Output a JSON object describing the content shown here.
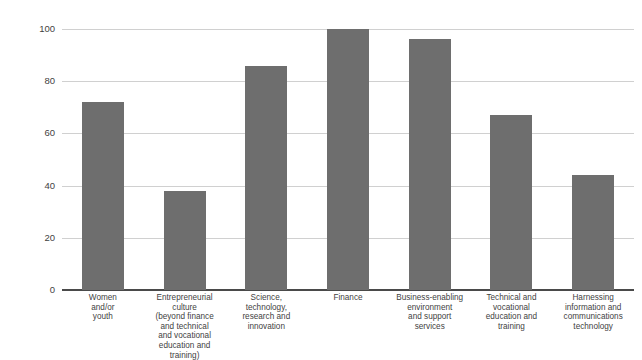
{
  "chart_data": {
    "type": "bar",
    "title": "",
    "subtitle": "",
    "xlabel": "",
    "ylabel": "",
    "ylim": [
      0,
      100
    ],
    "yticks": [
      0,
      20,
      40,
      60,
      80,
      100
    ],
    "grid": "horizontal",
    "legend": "none",
    "bar_color": "#6e6e6e",
    "categories": [
      "Women and/or youth",
      "Entrepreneurial culture (beyond finance and technical and vocational education and training)",
      "Science, technology, research and innovation",
      "Finance",
      "Business-enabling environment and support services",
      "Technical and vocational education and training",
      "Harnessing information and communications technology"
    ],
    "values": [
      72,
      38,
      86,
      100,
      96,
      67,
      44
    ],
    "bars": [
      {
        "label": "Women and/or youth",
        "label_lines": [
          "Women",
          "and/or",
          "youth"
        ],
        "value": 72
      },
      {
        "label": "Entrepreneurial culture (beyond finance and technical and vocational education and training)",
        "label_lines": [
          "Entrepreneurial culture",
          "(beyond finance",
          "and technical",
          "and vocational",
          "education and training)"
        ],
        "value": 38
      },
      {
        "label": "Science, technology, research and innovation",
        "label_lines": [
          "Science,",
          "technology,",
          "research and",
          "innovation"
        ],
        "value": 86
      },
      {
        "label": "Finance",
        "label_lines": [
          "Finance"
        ],
        "value": 100
      },
      {
        "label": "Business-enabling environment and support services",
        "label_lines": [
          "Business-enabling",
          "environment",
          "and support",
          "services"
        ],
        "value": 96
      },
      {
        "label": "Technical and vocational education and training",
        "label_lines": [
          "Technical and",
          "vocational",
          "education and",
          "training"
        ],
        "value": 67
      },
      {
        "label": "Harnessing information and communications technology",
        "label_lines": [
          "Harnessing",
          "information and",
          "communications",
          "technology"
        ],
        "value": 44
      }
    ]
  },
  "axis": {
    "y_tick_labels": [
      "0",
      "20",
      "40",
      "60",
      "80",
      "100"
    ]
  }
}
